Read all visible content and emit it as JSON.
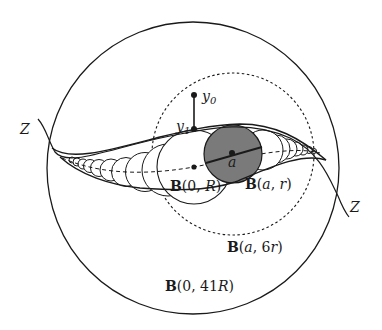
{
  "figure": {
    "type": "geometric-diagram",
    "colors": {
      "stroke": "#1a1a1a",
      "shaded_ball": "#7a7a7a",
      "background": "#ffffff"
    },
    "labels": {
      "curve_left": "Z",
      "curve_right": "Z",
      "point_y0": "y",
      "point_y0_sub": "0",
      "point_y1": "y",
      "point_y1_sub": "1",
      "point_a": "a",
      "ball_0_R": {
        "bold": "B",
        "args": "(0, ",
        "var": "R",
        "close": ")"
      },
      "ball_a_r": {
        "bold": "B",
        "args": "(",
        "var1": "a",
        "sep": ", ",
        "var2": "r",
        "close": ")"
      },
      "ball_a_6r": {
        "bold": "B",
        "args": "(",
        "var1": "a",
        "sep": ", 6",
        "var2": "r",
        "close": ")"
      },
      "ball_0_41R": {
        "bold": "B",
        "args": "(0, 41",
        "var": "R",
        "close": ")"
      }
    },
    "elements": {
      "outer_ball": {
        "name": "B(0,41R)",
        "style": "solid",
        "cx": 193,
        "cy": 168,
        "r": 146
      },
      "dashed_ball": {
        "name": "B(a,6r)",
        "style": "dashed",
        "cx": 233,
        "cy": 154,
        "r": 81
      },
      "shaded_ball": {
        "name": "B(a,r)",
        "style": "filled-gray",
        "cx": 233,
        "cy": 154,
        "r": 29
      },
      "center_ball": {
        "name": "B(0,R)",
        "style": "solid",
        "cx": 194,
        "cy": 167,
        "r": 37
      },
      "points": [
        {
          "name": "y0",
          "x": 194,
          "y": 95
        },
        {
          "name": "y1",
          "x": 194,
          "y": 129
        },
        {
          "name": "a",
          "x": 232,
          "y": 153
        },
        {
          "name": "0",
          "x": 194,
          "y": 167
        }
      ]
    }
  }
}
